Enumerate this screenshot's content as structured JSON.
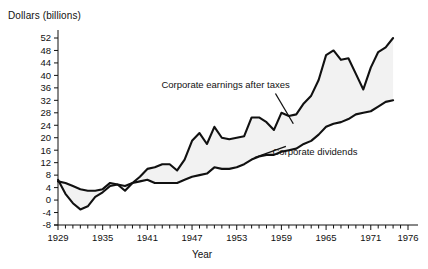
{
  "chart_data": {
    "type": "line",
    "title": "",
    "xlabel": "Year",
    "ylabel": "Dollars (billions)",
    "xlim": [
      1929,
      1976
    ],
    "ylim": [
      -8,
      52
    ],
    "ytick_step": 4,
    "yticks": [
      -8,
      -4,
      0,
      4,
      8,
      12,
      16,
      20,
      24,
      28,
      32,
      36,
      40,
      44,
      48,
      52
    ],
    "ytick_labels": [
      "-8",
      "-4",
      "0",
      "4",
      "8",
      "12",
      "16",
      "20",
      "24",
      "28",
      "32",
      "36",
      "40",
      "44",
      "48",
      "52"
    ],
    "xticks": [
      1929,
      1935,
      1941,
      1947,
      1953,
      1959,
      1965,
      1971,
      1976
    ],
    "xtick_labels": [
      "1929",
      "1935",
      "1941",
      "1947",
      "1953",
      "1959",
      "1965",
      "1971",
      "1976"
    ],
    "xtick_minor_step": 1,
    "grid": false,
    "legend_position": "inline-annotation",
    "fill_between": true,
    "fill_color": "#f2f2f2",
    "line_color": "#111111",
    "x": [
      1929,
      1930,
      1931,
      1932,
      1933,
      1934,
      1935,
      1936,
      1937,
      1938,
      1939,
      1940,
      1941,
      1942,
      1943,
      1944,
      1945,
      1946,
      1947,
      1948,
      1949,
      1950,
      1951,
      1952,
      1953,
      1954,
      1955,
      1956,
      1957,
      1958,
      1959,
      1960,
      1961,
      1962,
      1963,
      1964,
      1965,
      1966,
      1967,
      1968,
      1969,
      1970,
      1971,
      1972,
      1973,
      1974
    ],
    "series": [
      {
        "name": "Corporate earnings after taxes",
        "label": "Corporate earnings after taxes",
        "values": [
          6.5,
          2.0,
          -1.0,
          -3.0,
          -2.0,
          1.0,
          2.5,
          4.5,
          5.0,
          3.0,
          5.5,
          7.5,
          10.0,
          10.5,
          11.5,
          11.5,
          9.5,
          13.0,
          19.0,
          21.5,
          18.0,
          23.5,
          20.0,
          19.5,
          20.0,
          20.5,
          26.5,
          26.5,
          25.0,
          22.5,
          28.0,
          27.0,
          27.5,
          31.0,
          33.5,
          38.5,
          46.5,
          48.0,
          45.0,
          45.5,
          40.5,
          35.5,
          42.5,
          47.5,
          49.0,
          52.0
        ]
      },
      {
        "name": "Corporate dividends",
        "label": "Corporate dividends",
        "values": [
          6.0,
          5.5,
          4.5,
          3.5,
          3.0,
          3.0,
          3.5,
          5.5,
          5.0,
          4.5,
          5.5,
          6.0,
          6.5,
          5.5,
          5.5,
          5.5,
          5.5,
          6.5,
          7.5,
          8.0,
          8.5,
          10.5,
          10.0,
          10.0,
          10.5,
          11.5,
          13.0,
          14.0,
          14.5,
          14.5,
          15.5,
          16.0,
          16.5,
          18.0,
          19.0,
          21.0,
          23.5,
          24.5,
          25.0,
          26.0,
          27.5,
          28.0,
          28.5,
          30.0,
          31.5,
          32.0
        ]
      }
    ],
    "annotations": [
      {
        "text": "Corporate earnings after taxes",
        "x": 1951.5,
        "y": 36.0
      },
      {
        "text": "Corporate dividends",
        "x": 1963.5,
        "y": 14.5
      }
    ]
  }
}
